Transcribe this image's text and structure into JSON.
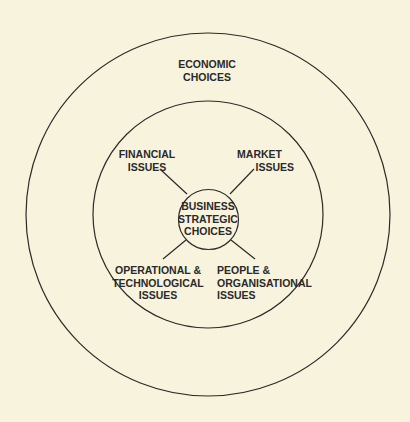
{
  "diagram": {
    "type": "concentric-circles",
    "background_color": "#f7f3dc",
    "line_color": "#2a2a2a",
    "outer_ring": {
      "label_lines": [
        "ECONOMIC",
        "CHOICES"
      ]
    },
    "center": {
      "label_lines": [
        "BUSINESS",
        "STRATEGIC",
        "CHOICES"
      ]
    },
    "spokes": [
      {
        "id": "financial",
        "position": "top-left",
        "label_lines": [
          "FINANCIAL",
          "ISSUES"
        ]
      },
      {
        "id": "market",
        "position": "top-right",
        "label_lines": [
          "MARKET",
          "ISSUES"
        ]
      },
      {
        "id": "operational",
        "position": "bottom-left",
        "label_lines": [
          "OPERATIONAL &",
          "TECHNOLOGICAL",
          "ISSUES"
        ]
      },
      {
        "id": "people",
        "position": "bottom-right",
        "label_lines": [
          "PEOPLE &",
          "ORGANISATIONAL",
          "ISSUES"
        ]
      }
    ]
  }
}
